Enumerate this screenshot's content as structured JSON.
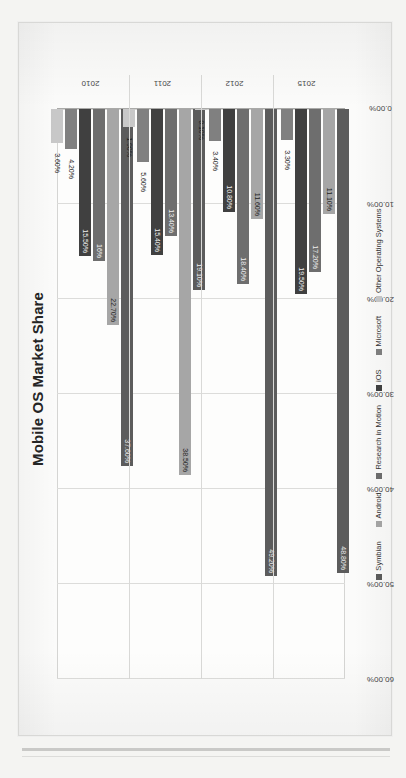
{
  "document": {
    "orientation": "rotated-90",
    "paper_color": "#f4f4f2",
    "sheet_color": "#fbfbfa"
  },
  "chart_data": {
    "type": "bar",
    "orientation": "horizontal",
    "title": "Mobile OS Market Share",
    "xlabel": "",
    "ylabel": "",
    "xlim": [
      0,
      60
    ],
    "grid": true,
    "legend_position": "bottom",
    "categories": [
      "2010",
      "2011",
      "2012",
      "2015"
    ],
    "tick_labels": [
      "0.00%",
      "10.00%",
      "20.00%",
      "30.00%",
      "40.00%",
      "50.00%",
      "60.00%"
    ],
    "tick_values": [
      0,
      10,
      20,
      30,
      40,
      50,
      60
    ],
    "series": [
      {
        "name": "Symbian",
        "color": "#5c5c5c",
        "values": [
          37.6,
          19.1,
          49.2,
          48.8
        ],
        "labels": [
          "37.60%",
          "19.10%",
          "49.20%",
          "48.80%"
        ]
      },
      {
        "name": "Android",
        "color": "#a6a6a6",
        "values": [
          22.7,
          38.5,
          11.6,
          11.1
        ],
        "labels": [
          "22.70%",
          "38.50%",
          "11.60%",
          "11.10%"
        ]
      },
      {
        "name": "Research in Motion",
        "color": "#6e6e6e",
        "values": [
          16.0,
          13.4,
          18.4,
          17.2
        ],
        "labels": [
          "16%",
          "13.40%",
          "18.40%",
          "17.20%"
        ]
      },
      {
        "name": "iOS",
        "color": "#404040",
        "values": [
          15.5,
          15.4,
          10.8,
          19.5
        ],
        "labels": [
          "15.50%",
          "15.40%",
          "10.80%",
          "19.50%"
        ]
      },
      {
        "name": "Microsoft",
        "color": "#808080",
        "values": [
          4.2,
          5.6,
          3.4,
          3.3
        ],
        "labels": [
          "4.20%",
          "5.60%",
          "3.40%",
          "3.30%"
        ]
      },
      {
        "name": "Other Operating Systems",
        "color": "#c8c8c8",
        "values": [
          3.6,
          1.9,
          0.1,
          0.0
        ],
        "labels": [
          "3.60%",
          "1.90%",
          "0.10%",
          ""
        ]
      }
    ]
  }
}
